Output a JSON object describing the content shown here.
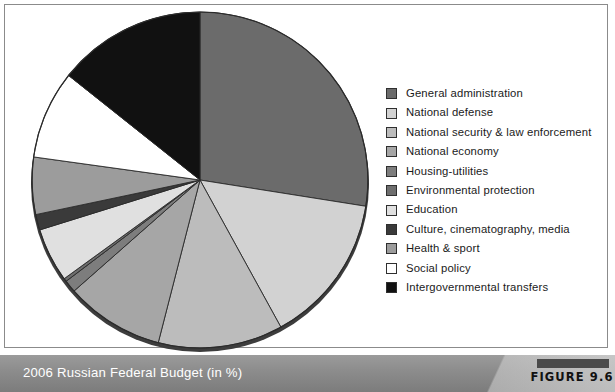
{
  "figure": {
    "caption": "2006 Russian Federal Budget (in %)",
    "tag": "FIGURE 9.6"
  },
  "legend": {
    "items": [
      {
        "label": "General administration",
        "color": "#6b6b6b"
      },
      {
        "label": "National defense",
        "color": "#d2d2d2"
      },
      {
        "label": "National security & law enforcement",
        "color": "#bcbcbc"
      },
      {
        "label": "National economy",
        "color": "#a6a6a6"
      },
      {
        "label": "Housing-utilities",
        "color": "#7d7d7d"
      },
      {
        "label": "Environmental protection",
        "color": "#6e6e6e"
      },
      {
        "label": "Education",
        "color": "#e0e0e0"
      },
      {
        "label": "Culture, cinematography, media",
        "color": "#3a3a3a"
      },
      {
        "label": "Health & sport",
        "color": "#9c9c9c"
      },
      {
        "label": "Social policy",
        "color": "#ffffff"
      },
      {
        "label": "Intergovernmental transfers",
        "color": "#111111"
      }
    ]
  },
  "chart_data": {
    "type": "pie",
    "title": "2006 Russian Federal Budget (in %)",
    "units": "%",
    "start_angle_deg": 0,
    "direction": "clockwise",
    "legend_position": "right",
    "center": {
      "x": 200,
      "y": 180
    },
    "radius": 168,
    "categories": [
      "General administration",
      "National defense",
      "National security & law enforcement",
      "National economy",
      "Housing-utilities",
      "Environmental protection",
      "Education",
      "Culture, cinematography, media",
      "Health & sport",
      "Social policy",
      "Intergovernmental transfers"
    ],
    "values": [
      27.5,
      14.5,
      12.0,
      9.5,
      1.2,
      0.3,
      5.2,
      1.5,
      5.5,
      8.5,
      14.3
    ],
    "colors": [
      "#6b6b6b",
      "#d2d2d2",
      "#bcbcbc",
      "#a6a6a6",
      "#7d7d7d",
      "#6e6e6e",
      "#e0e0e0",
      "#3a3a3a",
      "#9c9c9c",
      "#ffffff",
      "#111111"
    ],
    "slice_boundaries_deg": [
      0,
      99,
      151.2,
      194.4,
      228.6,
      232.9,
      234,
      252.7,
      258.1,
      277.9,
      308.5,
      360
    ],
    "slice_edge_color": "#2b2b2b"
  }
}
